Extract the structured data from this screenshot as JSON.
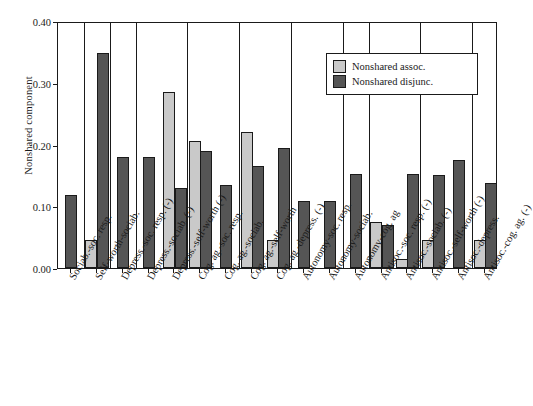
{
  "chart_data": {
    "type": "bar",
    "title": "",
    "xlabel": "",
    "ylabel": "Nonshared component",
    "ylim": [
      0.0,
      0.4
    ],
    "ytick_labels": [
      "0.00",
      "0.10",
      "0.20",
      "0.30",
      "0.40"
    ],
    "ytick_values": [
      0.0,
      0.1,
      0.2,
      0.3,
      0.4
    ],
    "grid": false,
    "legend_position": "top-right",
    "categories": [
      "Sociab.-soc. resp.",
      "Self-worth-sociab.",
      "Depress.-soc. resp. (-)",
      "Depress.-sociab. (-)",
      "Depress.-self-worth (-)",
      "Cog. ag.-soc. resp.",
      "Cog. ag.-sociab.",
      "Cog. ag.-self-worth",
      "Cog. ag.-depress. (-)",
      "Autonomy-soc. resp.",
      "Autonomy-sociab.",
      "Autonomy-cog. ag",
      "Antisoc.-soc. resp. (-)",
      "Antisoc.-sociab. (-)",
      "Antisoc.-self-worth (-)",
      "Antisoc.-depress.",
      "Antisoc.-cog. ag. (-)"
    ],
    "series": [
      {
        "name": "Nonshared assoc.",
        "color": "#c9c9c9",
        "values": [
          0.0,
          0.045,
          0.0,
          0.0,
          0.285,
          0.205,
          0.0,
          0.22,
          0.045,
          0.0,
          0.0,
          0.0,
          0.075,
          0.015,
          0.045,
          0.0,
          0.045
        ]
      },
      {
        "name": "Nonshared disjunc.",
        "color": "#555555",
        "values": [
          0.118,
          0.348,
          0.18,
          0.18,
          0.13,
          0.19,
          0.135,
          0.165,
          0.195,
          0.108,
          0.108,
          0.152,
          0.07,
          0.152,
          0.15,
          0.175,
          0.138
        ]
      }
    ]
  },
  "legend": {
    "items": [
      {
        "label": "Nonshared assoc.",
        "swatch": "assoc"
      },
      {
        "label": "Nonshared disjunc.",
        "swatch": "disjunc"
      }
    ]
  }
}
